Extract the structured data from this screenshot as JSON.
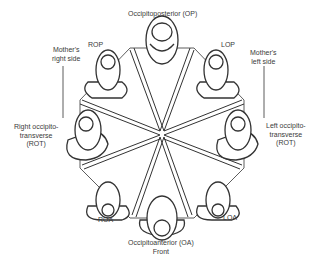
{
  "diagram": {
    "top_label": "Occipitoposterior (OP)",
    "bottom_label_1": "Occipitoanterior (OA)",
    "bottom_label_2": "Front",
    "rop": "ROP",
    "lop": "LOP",
    "roa": "ROA",
    "loa": "LOA",
    "mother_right_1": "Mother's",
    "mother_right_2": "right side",
    "mother_left_1": "Mother's",
    "mother_left_2": "left side",
    "rot_1": "Right occipito-",
    "rot_2": "transverse",
    "rot_3": "(ROT)",
    "lot_1": "Left occipito-",
    "lot_2": "transverse",
    "lot_3": "(ROT)"
  }
}
